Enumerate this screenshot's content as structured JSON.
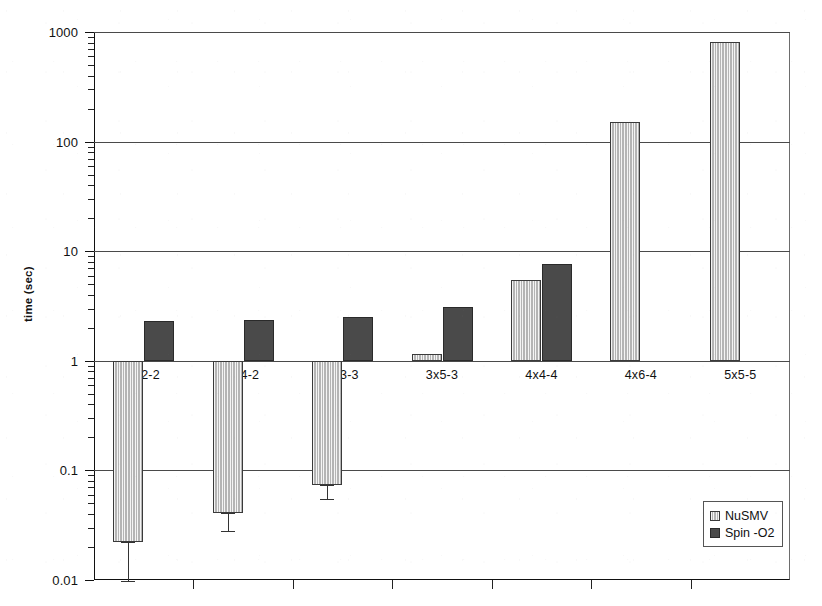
{
  "chart_data": {
    "type": "bar",
    "title": "",
    "xlabel": "",
    "ylabel": "time (sec)",
    "yscale": "log",
    "ylim": [
      0.01,
      1000
    ],
    "baseline": 1,
    "grid": true,
    "legend_position": "bottom-right",
    "y_ticks": [
      "1000",
      "100",
      "10",
      "1",
      "0.1",
      "0.01"
    ],
    "y_tick_values": [
      1000,
      100,
      10,
      1,
      0.1,
      0.01
    ],
    "categories": [
      "2x2-2",
      "2x4-2",
      "3x3-3",
      "3x5-3",
      "4x4-4",
      "4x6-4",
      "5x5-5"
    ],
    "series": [
      {
        "name": "NuSMV",
        "style": "light-hatched",
        "color": "#b4b4b4",
        "values": [
          0.022,
          0.041,
          0.074,
          1.15,
          5.5,
          150,
          810
        ],
        "error_low": [
          0.0098,
          0.028,
          0.055,
          null,
          null,
          null,
          null
        ],
        "error_high": [
          0.022,
          0.041,
          0.074,
          null,
          null,
          null,
          null
        ]
      },
      {
        "name": "Spin -O2",
        "style": "dark-solid",
        "color": "#4a4a4a",
        "values": [
          2.3,
          2.35,
          2.5,
          3.1,
          7.7,
          null,
          null
        ]
      }
    ]
  },
  "legend": {
    "items": [
      {
        "label": "NuSMV"
      },
      {
        "label": "Spin -O2"
      }
    ]
  },
  "axis": {
    "y_title": "time (sec)",
    "y_labels": [
      "1000",
      "100",
      "10",
      "1",
      "0.1",
      "0.01"
    ]
  }
}
